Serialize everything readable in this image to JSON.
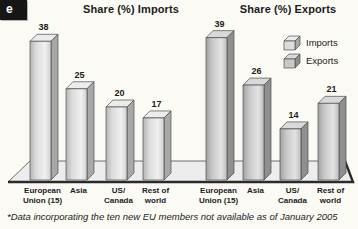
{
  "figure_tab": {
    "label": "e"
  },
  "titles": {
    "imports": "Share (%) Imports",
    "exports": "Share (%) Exports"
  },
  "legend": {
    "items": [
      {
        "label": "Imports"
      },
      {
        "label": "Exports"
      }
    ]
  },
  "footnote": "*Data incorporating the ten new EU members not available as of January 2005",
  "chart_data": {
    "type": "bar",
    "style": "3d-bars",
    "categories": [
      "European Union (15)",
      "Asia",
      "US/Canada",
      "Rest of world"
    ],
    "categories_lines": [
      [
        "European",
        "Union (15)"
      ],
      [
        "Asia"
      ],
      [
        "US/",
        "Canada"
      ],
      [
        "Rest of",
        "world"
      ]
    ],
    "series": [
      {
        "name": "Imports",
        "title": "Share (%) Imports",
        "values": [
          38,
          25,
          20,
          17
        ]
      },
      {
        "name": "Exports",
        "title": "Share (%) Exports",
        "values": [
          39,
          26,
          14,
          21
        ]
      }
    ],
    "unit": "% share",
    "ylim": [
      0,
      40
    ],
    "grid": false,
    "axes_shown": false,
    "legend_position": "top-right"
  },
  "colors": {
    "background": "#fbfaf5",
    "tab_bg": "#161616",
    "tab_text": "#ffffff",
    "text": "#1c1c1c",
    "outline": "#4d4d4d",
    "platform_fill": "#ededed",
    "platform_edge_dark": "#2b2b2b",
    "imports": {
      "front_dark": "#b5b5b5",
      "front_mid": "#dcdcdc",
      "front_light": "#f0f0f0",
      "front_right": "#cfcfcf",
      "top": "#ececec",
      "side": "#a8a8a8"
    },
    "exports": {
      "front_dark": "#a2a2a2",
      "front_mid": "#c8c8c8",
      "front_light": "#e3e3e3",
      "front_right": "#bcbcbc",
      "top": "#d9d9d9",
      "side": "#8f8f8f"
    }
  }
}
